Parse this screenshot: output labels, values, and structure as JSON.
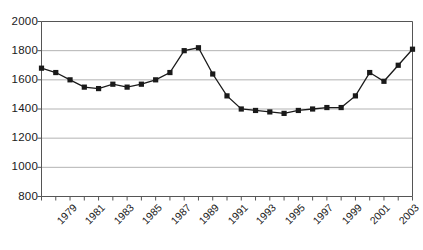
{
  "chart_data": {
    "type": "line",
    "title": "",
    "subtitle": "",
    "xlabel": "",
    "ylabel": "",
    "grid": true,
    "legend": false,
    "legend_position": "none",
    "marker": "square",
    "marker_color": "#1a1a1a",
    "line_color": "#1a1a1a",
    "xlim": [
      1979,
      2005
    ],
    "ylim": [
      800,
      2000
    ],
    "ytick_step": 200,
    "xtick_label_step": 2,
    "x": [
      1979,
      1980,
      1981,
      1982,
      1983,
      1984,
      1985,
      1986,
      1987,
      1988,
      1989,
      1990,
      1991,
      1992,
      1993,
      1994,
      1995,
      1996,
      1997,
      1998,
      1999,
      2000,
      2001,
      2002,
      2003,
      2004,
      2005
    ],
    "values": [
      1680,
      1650,
      1600,
      1550,
      1540,
      1570,
      1550,
      1570,
      1600,
      1650,
      1800,
      1820,
      1640,
      1490,
      1400,
      1390,
      1380,
      1370,
      1390,
      1400,
      1410,
      1410,
      1490,
      1650,
      1590,
      1700,
      1810
    ],
    "ytick_labels": [
      "2000",
      "1800",
      "1600",
      "1400",
      "1200",
      "1000",
      "800"
    ],
    "ytick_values": [
      2000,
      1800,
      1600,
      1400,
      1200,
      1000,
      800
    ],
    "xtick_labels": [
      "1979",
      "1981",
      "1983",
      "1985",
      "1987",
      "1989",
      "1991",
      "1993",
      "1995",
      "1997",
      "1999",
      "2001",
      "2003",
      "2005"
    ],
    "xtick_label_values": [
      1979,
      1981,
      1983,
      1985,
      1987,
      1989,
      1991,
      1993,
      1995,
      1997,
      1999,
      2001,
      2003,
      2005
    ]
  },
  "colors": {
    "axis": "#555555",
    "grid": "#aaaaaa",
    "series": "#1a1a1a",
    "background": "#ffffff",
    "text": "#1a1a1a"
  }
}
